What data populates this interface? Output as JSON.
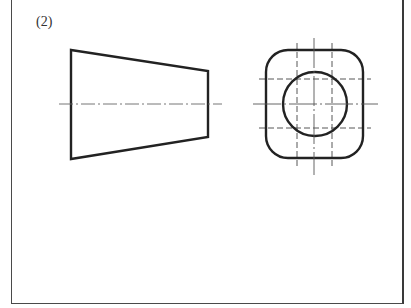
{
  "figure": {
    "label": "(2)",
    "views": [
      {
        "name": "front-view",
        "shape": "trapezoid",
        "points": [
          [
            71,
            50
          ],
          [
            208,
            71
          ],
          [
            208,
            137
          ],
          [
            71,
            159
          ]
        ],
        "centerline_y": 104,
        "centerline_x_range": [
          59,
          222
        ]
      },
      {
        "name": "side-view",
        "shape": "rounded-square",
        "bounds": [
          266,
          50,
          363,
          158
        ],
        "corner_radius": 22,
        "circle": {
          "cx": 315,
          "cy": 104,
          "r": 32
        },
        "centerlines": {
          "horizontal_y": 104,
          "horizontal_x_range": [
            253,
            378
          ],
          "vertical_x": 314,
          "vertical_y_range": [
            38,
            175
          ]
        },
        "hidden_lines": {
          "vertical_x": [
            297,
            332
          ],
          "horizontal_y": [
            79,
            128
          ]
        }
      }
    ]
  },
  "colors": {
    "outline": "#222222",
    "centerline": "#555555",
    "hidden": "#444444",
    "frame": "#444444"
  }
}
